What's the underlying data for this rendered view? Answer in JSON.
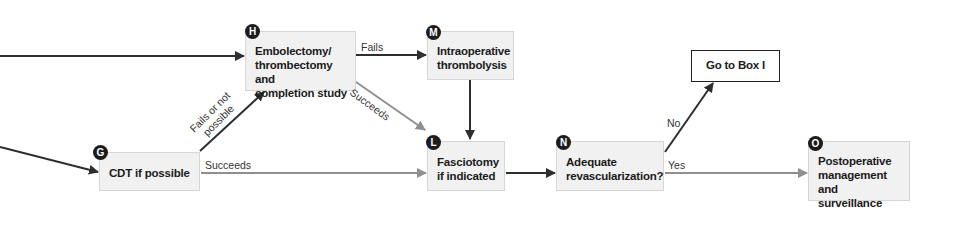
{
  "diagram": {
    "colors": {
      "dark_arrow": "#2e2e2e",
      "gray_arrow": "#8f8f8f",
      "box_fill": "#f1f1f1",
      "badge": "#1c1c1c"
    },
    "nodes": {
      "G": {
        "badge": "G",
        "text": "CDT if possible"
      },
      "H": {
        "badge": "H",
        "line1": "Embolectomy/",
        "line2": "thrombectomy and",
        "line3": "completion study"
      },
      "M": {
        "badge": "M",
        "line1": "Intraoperative",
        "line2": "thrombolysis"
      },
      "L": {
        "badge": "L",
        "line1": "Fasciotomy",
        "line2": "if indicated"
      },
      "N": {
        "badge": "N",
        "line1": "Adequate",
        "line2": "revascularization?"
      },
      "BoxI": {
        "text": "Go to Box I"
      },
      "O": {
        "badge": "O",
        "line1": "Postoperative",
        "line2": "management and",
        "line3": "surveillance"
      }
    },
    "edge_labels": {
      "h_to_m": "Fails",
      "h_to_l": "Succeeds",
      "g_to_h_line1": "Fails or not",
      "g_to_h_line2": "possible",
      "g_to_l": "Succeeds",
      "n_to_boxi": "No",
      "n_to_o": "Yes"
    }
  }
}
